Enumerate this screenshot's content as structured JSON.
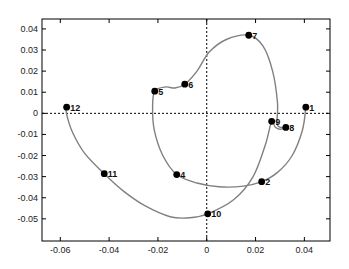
{
  "chart_data": {
    "type": "line",
    "title": "",
    "xlabel": "",
    "ylabel": "",
    "xlim": [
      -0.0675,
      0.0505
    ],
    "ylim": [
      -0.0605,
      0.0447
    ],
    "grid": false,
    "legend": null,
    "x_ticks": [
      -0.06,
      -0.04,
      -0.02,
      0,
      0.02,
      0.04
    ],
    "x_tick_labels": [
      "-0.06",
      "-0.04",
      "-0.02",
      "0",
      "0.02",
      "0.04"
    ],
    "y_ticks": [
      0.04,
      0.03,
      0.02,
      0.01,
      0,
      -0.01,
      -0.02,
      -0.03,
      -0.04,
      -0.05
    ],
    "y_tick_labels": [
      "0.04",
      "0.03",
      "0.02",
      "0.01",
      "0",
      "-0.01",
      "-0.02",
      "-0.03",
      "-0.04",
      "-0.05"
    ],
    "reference_lines": [
      {
        "orientation": "horizontal",
        "value": 0,
        "style": "dotted"
      },
      {
        "orientation": "vertical",
        "value": 0,
        "style": "dotted"
      }
    ],
    "curve_color": "#808080",
    "marker_color": "#000000",
    "series": [
      {
        "name": "labeled points",
        "points": [
          {
            "label": "1",
            "x": 0.0406,
            "y": 0.0029
          },
          {
            "label": "2",
            "x": 0.0225,
            "y": -0.0324
          },
          {
            "label": "4",
            "x": -0.0123,
            "y": -0.029
          },
          {
            "label": "5",
            "x": -0.0213,
            "y": 0.0105
          },
          {
            "label": "6",
            "x": -0.009,
            "y": 0.0138
          },
          {
            "label": "7",
            "x": 0.0172,
            "y": 0.037
          },
          {
            "label": "8",
            "x": 0.0324,
            "y": -0.0067
          },
          {
            "label": "9",
            "x": 0.0266,
            "y": -0.0038
          },
          {
            "label": "10",
            "x": 0.0004,
            "y": -0.0476
          },
          {
            "label": "11",
            "x": -0.042,
            "y": -0.0286
          },
          {
            "label": "12",
            "x": -0.0574,
            "y": 0.0029
          }
        ]
      }
    ],
    "curve_path": [
      [
        0.0406,
        0.0029
      ],
      [
        0.0392,
        -0.008
      ],
      [
        0.035,
        -0.02
      ],
      [
        0.029,
        -0.028
      ],
      [
        0.0225,
        -0.0324
      ],
      [
        0.015,
        -0.0345
      ],
      [
        0.005,
        -0.0348
      ],
      [
        -0.004,
        -0.033
      ],
      [
        -0.0123,
        -0.029
      ],
      [
        -0.018,
        -0.02
      ],
      [
        -0.0215,
        -0.008
      ],
      [
        -0.0222,
        0.003
      ],
      [
        -0.0213,
        0.0105
      ],
      [
        -0.017,
        0.0125
      ],
      [
        -0.013,
        0.012
      ],
      [
        -0.009,
        0.0138
      ],
      [
        -0.004,
        0.02
      ],
      [
        0.001,
        0.029
      ],
      [
        0.008,
        0.035
      ],
      [
        0.0172,
        0.037
      ],
      [
        0.023,
        0.032
      ],
      [
        0.027,
        0.02
      ],
      [
        0.029,
        0.005
      ],
      [
        0.029,
        -0.0055
      ],
      [
        0.0324,
        -0.0067
      ],
      [
        0.03,
        -0.0075
      ],
      [
        0.028,
        -0.0065
      ],
      [
        0.0266,
        -0.0038
      ],
      [
        0.024,
        -0.015
      ],
      [
        0.019,
        -0.03
      ],
      [
        0.011,
        -0.041
      ],
      [
        0.0004,
        -0.0476
      ],
      [
        -0.007,
        -0.0495
      ],
      [
        -0.015,
        -0.049
      ],
      [
        -0.025,
        -0.044
      ],
      [
        -0.034,
        -0.037
      ],
      [
        -0.042,
        -0.0286
      ],
      [
        -0.05,
        -0.019
      ],
      [
        -0.055,
        -0.009
      ],
      [
        -0.0575,
        0.0
      ],
      [
        -0.0574,
        0.0029
      ]
    ]
  },
  "layout": {
    "plot_box": {
      "left": 42,
      "top": 19,
      "right": 330,
      "bottom": 241
    }
  }
}
